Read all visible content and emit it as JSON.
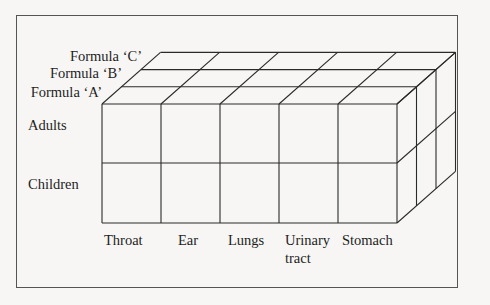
{
  "diagram": {
    "type": "3d-cube-matrix",
    "depth_axis": {
      "labels": [
        "Formula 'A'",
        "Formula 'B'",
        "Formula 'C'"
      ]
    },
    "row_axis": {
      "labels": [
        "Adults",
        "Children"
      ]
    },
    "column_axis": {
      "labels": [
        "Throat",
        "Ear",
        "Lungs",
        "Urinary",
        "Stomach"
      ],
      "label_line2": [
        "",
        "",
        "",
        "tract",
        ""
      ]
    },
    "labels": {
      "formula_c": "Formula ‘C’",
      "formula_b": "Formula ‘B’",
      "formula_a": "Formula ‘A’",
      "adults": "Adults",
      "children": "Children",
      "throat": "Throat",
      "ear": "Ear",
      "lungs": "Lungs",
      "urinary": "Urinary",
      "tract": "tract",
      "stomach": "Stomach"
    },
    "colors": {
      "line": "#2a2a2a",
      "frame": "#555555",
      "background": "#f7f6f4"
    }
  }
}
